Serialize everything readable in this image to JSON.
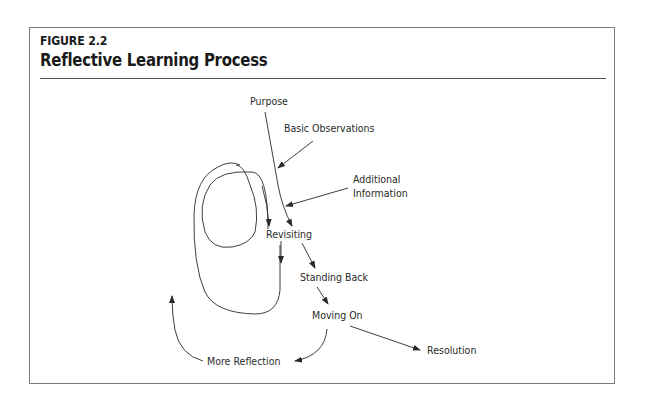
{
  "figure": {
    "label": "FIGURE 2.2",
    "title": "Reflective Learning Process"
  },
  "diagram": {
    "nodes": {
      "purpose": "Purpose",
      "basic_observations": "Basic Observations",
      "additional_information_line1": "Additional",
      "additional_information_line2": "Information",
      "revisiting": "Revisiting",
      "standing_back": "Standing Back",
      "moving_on": "Moving On",
      "more_reflection": "More Reflection",
      "resolution": "Resolution"
    },
    "edges": [
      {
        "from": "Purpose",
        "to": "Revisiting"
      },
      {
        "from": "Basic Observations",
        "to": "Purpose-Revisiting line"
      },
      {
        "from": "Additional Information",
        "to": "Purpose-Revisiting line"
      },
      {
        "from": "Revisiting",
        "to": "Revisiting (loop)"
      },
      {
        "from": "Revisiting",
        "to": "Standing Back"
      },
      {
        "from": "Standing Back",
        "to": "Moving On"
      },
      {
        "from": "Moving On",
        "to": "More Reflection"
      },
      {
        "from": "More Reflection",
        "to": "loop"
      },
      {
        "from": "Moving On",
        "to": "Resolution"
      }
    ]
  },
  "colors": {
    "stroke": "#2a2a2a",
    "frame": "#7a7a7a",
    "text": "#1a1a1a"
  }
}
